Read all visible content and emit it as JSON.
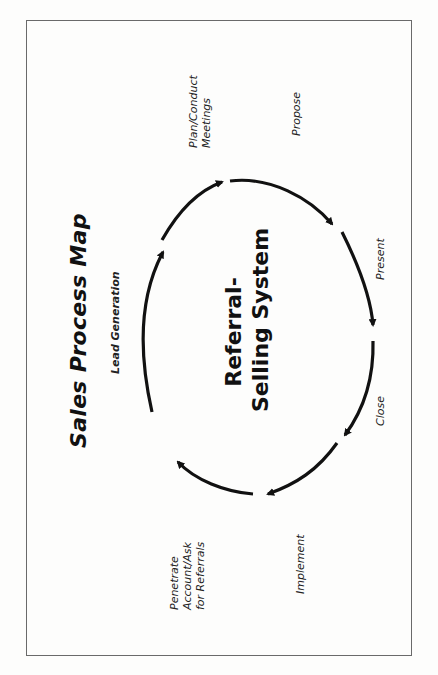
{
  "page_header": "",
  "diagram": {
    "title": "Sales Process Map",
    "center_label": {
      "line1": "Referral-",
      "line2": "Selling System"
    },
    "stages": [
      {
        "id": "lead_generation",
        "lines": [
          "Lead Generation"
        ]
      },
      {
        "id": "plan_conduct_meetings",
        "lines": [
          "Plan/Conduct",
          "Meetings"
        ]
      },
      {
        "id": "propose",
        "lines": [
          "Propose"
        ]
      },
      {
        "id": "present",
        "lines": [
          "Present"
        ]
      },
      {
        "id": "close",
        "lines": [
          "Close"
        ]
      },
      {
        "id": "implement",
        "lines": [
          "Implement"
        ]
      },
      {
        "id": "penetrate_account",
        "lines": [
          "Penetrate",
          "Account/Ask",
          "for Referrals"
        ]
      }
    ],
    "cycle_direction": "clockwise",
    "colors": {
      "arrow": "#111111",
      "frame": "#6a6a6a",
      "background": "#fdfdfc"
    }
  }
}
